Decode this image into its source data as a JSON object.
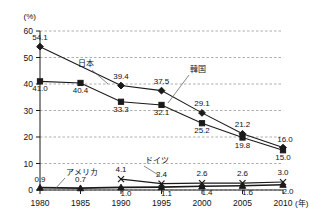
{
  "chart_data": {
    "type": "line",
    "title": "",
    "subtitle": "",
    "xlabel": "(年)",
    "ylabel": "(%)",
    "x": [
      1980,
      1985,
      1990,
      1995,
      2000,
      2005,
      2010
    ],
    "categories": [
      "1980",
      "1985",
      "1990",
      "1995",
      "2000",
      "2005",
      "2010"
    ],
    "xlim": [
      1980,
      2010
    ],
    "ylim": [
      0,
      60
    ],
    "yticks": [
      0,
      10,
      20,
      30,
      40,
      50,
      60
    ],
    "ytick_labels": [
      "0",
      "10",
      "20",
      "30",
      "40",
      "50",
      "60"
    ],
    "grid": true,
    "legend_position": "inline-annotations",
    "series": [
      {
        "name": "韓国",
        "marker": "diamond",
        "x": [
          1980,
          1985,
          1990,
          1995,
          2000,
          2005,
          2010
        ],
        "values": [
          54.1,
          null,
          39.4,
          37.5,
          29.1,
          21.2,
          16.0
        ],
        "labels": [
          "54.1",
          "",
          "39.4",
          "37.5",
          "29.1",
          "21.2",
          "16.0"
        ]
      },
      {
        "name": "日本",
        "marker": "square",
        "x": [
          1980,
          1985,
          1990,
          1995,
          2000,
          2005,
          2010
        ],
        "values": [
          41.0,
          40.4,
          33.3,
          32.1,
          25.2,
          19.8,
          15.0
        ],
        "labels": [
          "41.0",
          "40.4",
          "33.3",
          "32.1",
          "25.2",
          "19.8",
          "15.0"
        ]
      },
      {
        "name": "ドイツ",
        "marker": "cross",
        "x": [
          1990,
          1995,
          2000,
          2005,
          2010
        ],
        "values": [
          4.1,
          2.4,
          2.6,
          2.6,
          3.0
        ],
        "labels": [
          "4.1",
          "2.4",
          "2.6",
          "2.6",
          "3.0"
        ]
      },
      {
        "name": "アメリカ",
        "marker": "triangle",
        "x": [
          1980,
          1985,
          1990,
          1995,
          2000,
          2005,
          2010
        ],
        "values": [
          0.9,
          0.7,
          1.0,
          1.1,
          1.4,
          1.6,
          2.0
        ],
        "labels": [
          "0.9",
          "0.7",
          "1.0",
          "1.1",
          "1.4",
          "1.6",
          "2.0"
        ]
      }
    ],
    "annotations": [
      {
        "text": "韓国",
        "for_series": "韓国"
      },
      {
        "text": "日本",
        "for_series": "日本"
      },
      {
        "text": "ドイツ",
        "for_series": "ドイツ"
      },
      {
        "text": "アメリカ",
        "for_series": "アメリカ"
      }
    ]
  }
}
